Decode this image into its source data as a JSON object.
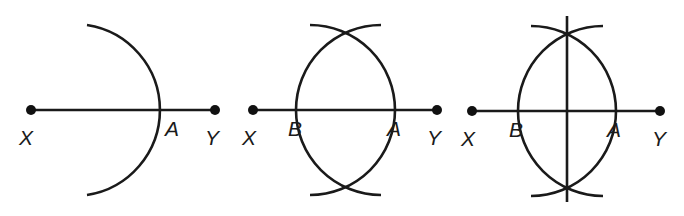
{
  "figure": {
    "panels": [
      {
        "step": 1,
        "labels": {
          "x": "X",
          "y": "Y",
          "a": "A"
        },
        "arcs": [
          "arc through A"
        ],
        "has_bisector": false
      },
      {
        "step": 2,
        "labels": {
          "x": "X",
          "y": "Y",
          "a": "A",
          "b": "B"
        },
        "arcs": [
          "arc through A",
          "arc through B"
        ],
        "has_bisector": false
      },
      {
        "step": 3,
        "labels": {
          "x": "X",
          "y": "Y",
          "a": "A",
          "b": "B"
        },
        "arcs": [
          "arc through A",
          "arc through B"
        ],
        "has_bisector": true
      }
    ]
  }
}
